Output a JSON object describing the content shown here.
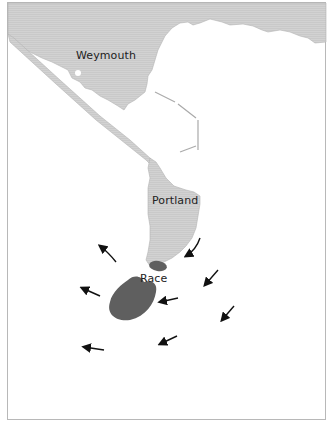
{
  "map": {
    "labels": {
      "weymouth": "Weymouth",
      "portland": "Portland",
      "race": "Race"
    },
    "colors": {
      "land": "#cfcfcf",
      "land_outline": "#b3b3b3",
      "race_area": "#5f5f5f",
      "arrow": "#111111",
      "water": "#ffffff",
      "frame": "#b8b8b8"
    },
    "features": [
      "mainland-coast",
      "chesil-beach-spit",
      "portland-harbour-breakwaters",
      "isle-of-portland",
      "race-shoal-small",
      "race-shoal-large",
      "current-arrows"
    ],
    "arrows_count": 10
  }
}
